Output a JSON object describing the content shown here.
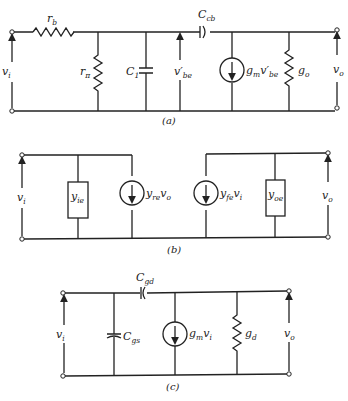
{
  "diagrams": [
    {
      "caption": "(a)",
      "labels": {
        "vi": "v",
        "vi_sub": "i",
        "rb": "r",
        "rb_sub": "b",
        "rpi": "r",
        "rpi_sub": "π",
        "c1": "C",
        "c1_sub": "1",
        "vbe": "v′",
        "vbe_sub": "be",
        "ccb": "C",
        "ccb_sub": "cb",
        "gm_src": "g",
        "gm_src_sub": "m",
        "gm_src_v": "v′",
        "gm_src_v_sub": "be",
        "go": "g",
        "go_sub": "o",
        "vo": "v",
        "vo_sub": "o"
      }
    },
    {
      "caption": "(b)",
      "labels": {
        "vi": "v",
        "vi_sub": "i",
        "yie": "y",
        "yie_sub": "ie",
        "yre_src": "y",
        "yre_src_sub": "re",
        "yre_src_v": "v",
        "yre_src_v_sub": "o",
        "yfe_src": "y",
        "yfe_src_sub": "fe",
        "yfe_src_v": "v",
        "yfe_src_v_sub": "i",
        "yoe": "y",
        "yoe_sub": "oe",
        "vo": "v",
        "vo_sub": "o"
      }
    },
    {
      "caption": "(c)",
      "labels": {
        "vi": "v",
        "vi_sub": "i",
        "cgd": "C",
        "cgd_sub": "gd",
        "cgs": "C",
        "cgs_sub": "gs",
        "gm_src": "g",
        "gm_src_sub": "m",
        "gm_src_v": "v",
        "gm_src_v_sub": "i",
        "gd": "g",
        "gd_sub": "d",
        "vo": "v",
        "vo_sub": "o"
      }
    }
  ]
}
